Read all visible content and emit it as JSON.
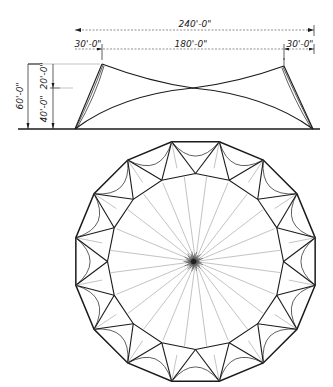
{
  "elevation": {
    "overall_span_label": "240'-0\"",
    "left_bay_label": "30'-0\"",
    "center_span_label": "180'-0\"",
    "right_bay_label": "30'-0\"",
    "total_height_label": "60'-0\"",
    "upper_height_label": "20'-0\"",
    "lower_height_label": "40'-0\""
  },
  "plan": {
    "outer_polygon_sides": 16,
    "inner_polygon_sides": 16,
    "center_radial_lines": 24
  },
  "colors": {
    "ink": "#1a1a1a",
    "faint_ink": "#9a9a9a",
    "paper": "#ffffff"
  }
}
